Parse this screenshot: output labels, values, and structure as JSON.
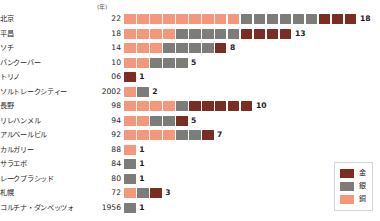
{
  "chart_data": {
    "type": "bar",
    "title": "",
    "subtitle": "",
    "unit_label": "(年)",
    "xlabel": "",
    "ylabel": "",
    "grid": false,
    "legend_position": "bottom-right",
    "series": [
      {
        "name": "金",
        "key": "gold",
        "color": "#7b2d22"
      },
      {
        "name": "銀",
        "key": "silver",
        "color": "#7c7c78"
      },
      {
        "name": "銅",
        "key": "bronze",
        "color": "#f4977a"
      }
    ],
    "categories": [
      "北京",
      "平昌",
      "ソチ",
      "バンクーバー",
      "トリノ",
      "ソルトレークシティー",
      "長野",
      "リレハンメル",
      "アルベールビル",
      "カルガリー",
      "サラエボ",
      "レークプラシッド",
      "札幌",
      "コルチナ・ダンペッツォ"
    ],
    "years": [
      "22",
      "18",
      "14",
      "10",
      "06",
      "2002",
      "98",
      "94",
      "92",
      "88",
      "84",
      "80",
      "72",
      "1956"
    ],
    "stack_order": [
      "bronze",
      "silver",
      "gold"
    ],
    "rows": [
      {
        "city": "北京",
        "year": "22",
        "bronze": 9,
        "silver": 6,
        "gold": 3,
        "total": "18"
      },
      {
        "city": "平昌",
        "year": "18",
        "bronze": 4,
        "silver": 5,
        "gold": 4,
        "total": "13"
      },
      {
        "city": "ソチ",
        "year": "14",
        "bronze": 3,
        "silver": 4,
        "gold": 1,
        "total": "8"
      },
      {
        "city": "バンクーバー",
        "year": "10",
        "bronze": 2,
        "silver": 3,
        "gold": 0,
        "total": "5"
      },
      {
        "city": "トリノ",
        "year": "06",
        "bronze": 0,
        "silver": 0,
        "gold": 1,
        "total": "1"
      },
      {
        "city": "ソルトレークシティー",
        "year": "2002",
        "bronze": 1,
        "silver": 1,
        "gold": 0,
        "total": "2"
      },
      {
        "city": "長野",
        "year": "98",
        "bronze": 4,
        "silver": 1,
        "gold": 5,
        "total": "10"
      },
      {
        "city": "リレハンメル",
        "year": "94",
        "bronze": 2,
        "silver": 2,
        "gold": 1,
        "total": "5"
      },
      {
        "city": "アルベールビル",
        "year": "92",
        "bronze": 4,
        "silver": 2,
        "gold": 1,
        "total": "7"
      },
      {
        "city": "カルガリー",
        "year": "88",
        "bronze": 1,
        "silver": 0,
        "gold": 0,
        "total": "1"
      },
      {
        "city": "サラエボ",
        "year": "84",
        "bronze": 0,
        "silver": 1,
        "gold": 0,
        "total": "1"
      },
      {
        "city": "レークプラシッド",
        "year": "80",
        "bronze": 0,
        "silver": 1,
        "gold": 0,
        "total": "1"
      },
      {
        "city": "札幌",
        "year": "72",
        "bronze": 1,
        "silver": 1,
        "gold": 1,
        "total": "3"
      },
      {
        "city": "コルチナ・ダンペッツォ",
        "year": "1956",
        "bronze": 0,
        "silver": 1,
        "gold": 0,
        "total": "1"
      }
    ],
    "legend": [
      {
        "label": "金",
        "color": "#7b2d22"
      },
      {
        "label": "銀",
        "color": "#7c7c78"
      },
      {
        "label": "銅",
        "color": "#f4977a"
      }
    ]
  }
}
